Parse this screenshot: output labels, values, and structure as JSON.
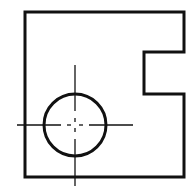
{
  "drawing": {
    "title": "Plate with rectangular notch and circular hole",
    "stroke_color": "#111111",
    "background_color": "#ffffff",
    "outline_points": "25,12 184,12 184,52 144,52 144,94 184,94 184,177 25,177",
    "hole": {
      "cx": 75,
      "cy": 125,
      "r": 31
    },
    "centerlines": {
      "horizontal": {
        "segments": [
          [
            17,
            61
          ],
          [
            67,
            71
          ],
          [
            79,
            83
          ],
          [
            89,
            133
          ]
        ],
        "y": 125
      },
      "vertical": {
        "segments": [
          [
            65,
            111
          ],
          [
            118,
            122
          ],
          [
            128,
            132
          ],
          [
            139,
            186
          ]
        ],
        "x": 75
      }
    }
  }
}
